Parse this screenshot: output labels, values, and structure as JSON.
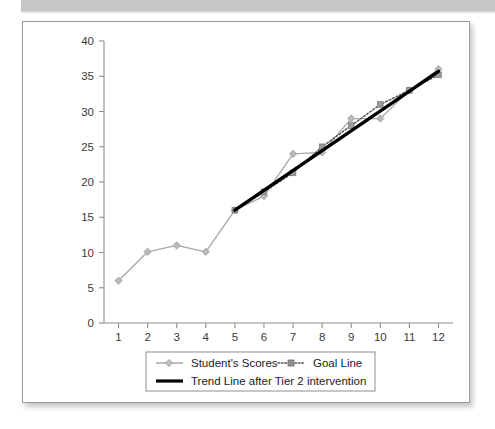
{
  "figure": {
    "frame_border_color": "#9b9b9b",
    "background": "#ffffff"
  },
  "chart_data": {
    "type": "line",
    "title": "",
    "subtitle": "",
    "xlabel": "",
    "ylabel": "",
    "x": [
      1,
      2,
      3,
      4,
      5,
      6,
      7,
      8,
      9,
      10,
      11,
      12
    ],
    "categories": [
      "1",
      "2",
      "3",
      "4",
      "5",
      "6",
      "7",
      "8",
      "9",
      "10",
      "11",
      "12"
    ],
    "xlim": [
      0.5,
      12.5
    ],
    "ylim": [
      0,
      40
    ],
    "y_ticks": [
      0,
      5,
      10,
      15,
      20,
      25,
      30,
      35,
      40
    ],
    "y_tick_labels": [
      "0",
      "5",
      "10",
      "15",
      "20",
      "25",
      "30",
      "35",
      "40"
    ],
    "x_ticks": [
      1,
      2,
      3,
      4,
      5,
      6,
      7,
      8,
      9,
      10,
      11,
      12
    ],
    "x_tick_labels": [
      "1",
      "2",
      "3",
      "4",
      "5",
      "6",
      "7",
      "8",
      "9",
      "10",
      "11",
      "12"
    ],
    "grid": false,
    "legend_position": "bottom",
    "series": [
      {
        "name": "Student's Scores",
        "style": "solid",
        "color": "#a8a8a8",
        "marker": "diamond",
        "marker_color": "#b9b9b9",
        "x": [
          1,
          2,
          3,
          4,
          5,
          6,
          7,
          8,
          9,
          10,
          11,
          12
        ],
        "values": [
          6,
          10.1,
          11,
          10.1,
          16,
          18,
          24,
          24.2,
          29,
          29,
          33,
          36
        ]
      },
      {
        "name": "Goal Line",
        "style": "dotted",
        "color": "#555555",
        "marker": "square",
        "marker_color": "#9a9a9a",
        "x": [
          5,
          6,
          7,
          8,
          9,
          10,
          11,
          12
        ],
        "values": [
          16,
          18.6,
          21.3,
          25,
          28,
          31,
          33,
          35.2
        ]
      },
      {
        "name": "Trend Line after Tier 2 intervention",
        "style": "thick-solid",
        "color": "#000000",
        "marker": "none",
        "x": [
          5,
          12
        ],
        "values": [
          16,
          35.7
        ]
      }
    ]
  },
  "legend": {
    "items": [
      {
        "label": "Student's Scores",
        "marker": "diamond-marker",
        "line": "solid"
      },
      {
        "label": "Goal Line",
        "marker": "square-marker",
        "line": "dotted"
      },
      {
        "label": "Trend Line after Tier 2 intervention",
        "marker": "none",
        "line": "thick-solid"
      }
    ]
  }
}
